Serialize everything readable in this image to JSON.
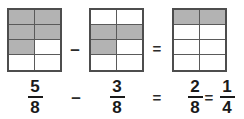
{
  "figure": {
    "shaded_color": "#b3b3b3",
    "cell_color": "#ffffff",
    "border_color": "#4d4d4d",
    "grid_line_color": "#5a5a5a"
  },
  "models": [
    {
      "name": "minuend-model",
      "rows": 4,
      "cols": 2,
      "total_cells": 8,
      "shaded_cells": 5,
      "fraction": "5/8",
      "shaded_map": [
        [
          true,
          true
        ],
        [
          true,
          true
        ],
        [
          true,
          false
        ],
        [
          false,
          false
        ]
      ]
    },
    {
      "name": "subtrahend-model",
      "rows": 4,
      "cols": 2,
      "total_cells": 8,
      "shaded_cells": 3,
      "fraction": "3/8",
      "shaded_map": [
        [
          false,
          false
        ],
        [
          true,
          true
        ],
        [
          true,
          false
        ],
        [
          false,
          false
        ]
      ]
    },
    {
      "name": "difference-model",
      "rows": 4,
      "cols": 2,
      "total_cells": 8,
      "shaded_cells": 2,
      "fraction": "2/8",
      "shaded_map": [
        [
          true,
          true
        ],
        [
          false,
          false
        ],
        [
          false,
          false
        ],
        [
          false,
          false
        ]
      ]
    }
  ],
  "operators": {
    "minus": "–",
    "equals": "=",
    "minus_bottom": "–",
    "equals_bottom": "=",
    "equals_simplified": "="
  },
  "equation": {
    "minuend": {
      "numerator": "5",
      "denominator": "8"
    },
    "subtrahend": {
      "numerator": "3",
      "denominator": "8"
    },
    "difference": {
      "numerator": "2",
      "denominator": "8"
    },
    "simplified": {
      "numerator": "1",
      "denominator": "4"
    },
    "text": "5/8 – 3/8 = 2/8 = 1/4"
  }
}
